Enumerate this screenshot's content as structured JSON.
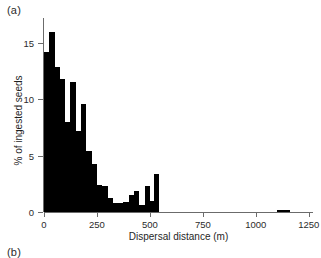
{
  "figure": {
    "panel_a_label": "(a)",
    "panel_b_label": "(b)"
  },
  "chart_data": {
    "type": "bar",
    "title": "",
    "subtitle": "",
    "xlabel": "Dispersal distance (m)",
    "ylabel": "% of ingested seeds",
    "xlim": [
      0,
      1270
    ],
    "ylim": [
      0,
      17.2
    ],
    "grid": false,
    "legend": null,
    "bin_width": 25,
    "axis_color": "#6b6b6b",
    "bar_color": "#000000",
    "xticks": [
      0,
      250,
      500,
      750,
      1000,
      1250
    ],
    "xtick_labels": [
      "0",
      "250",
      "500",
      "750",
      "1000",
      "1250"
    ],
    "yticks": [
      0,
      5,
      10,
      15
    ],
    "ytick_labels": [
      "0",
      "5",
      "10",
      "15"
    ],
    "bins": [
      {
        "x0": 0,
        "x1": 25,
        "value": 14.2
      },
      {
        "x0": 25,
        "x1": 50,
        "value": 16.0
      },
      {
        "x0": 50,
        "x1": 75,
        "value": 12.9
      },
      {
        "x0": 75,
        "x1": 100,
        "value": 11.8
      },
      {
        "x0": 100,
        "x1": 125,
        "value": 8.0
      },
      {
        "x0": 125,
        "x1": 150,
        "value": 11.5
      },
      {
        "x0": 150,
        "x1": 175,
        "value": 7.2
      },
      {
        "x0": 175,
        "x1": 200,
        "value": 9.6
      },
      {
        "x0": 200,
        "x1": 225,
        "value": 5.4
      },
      {
        "x0": 225,
        "x1": 250,
        "value": 4.3
      },
      {
        "x0": 250,
        "x1": 275,
        "value": 2.4
      },
      {
        "x0": 275,
        "x1": 300,
        "value": 2.3
      },
      {
        "x0": 300,
        "x1": 325,
        "value": 1.2
      },
      {
        "x0": 325,
        "x1": 350,
        "value": 0.8
      },
      {
        "x0": 350,
        "x1": 375,
        "value": 0.8
      },
      {
        "x0": 375,
        "x1": 400,
        "value": 0.9
      },
      {
        "x0": 400,
        "x1": 425,
        "value": 1.5
      },
      {
        "x0": 425,
        "x1": 450,
        "value": 1.9
      },
      {
        "x0": 450,
        "x1": 475,
        "value": 0.6
      },
      {
        "x0": 475,
        "x1": 500,
        "value": 2.3
      },
      {
        "x0": 500,
        "x1": 520,
        "value": 1.0
      },
      {
        "x0": 520,
        "x1": 545,
        "value": 3.4
      },
      {
        "x0": 1100,
        "x1": 1160,
        "value": 0.18
      }
    ]
  }
}
